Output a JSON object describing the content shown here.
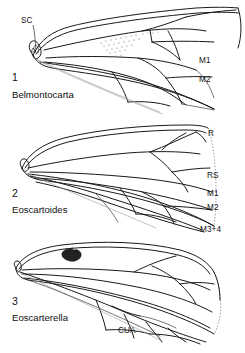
{
  "plate": {
    "title": "Fossil cicadomorph forewing venation plate",
    "background_color": "#ffffff",
    "ink_color": "#1a1a1a",
    "figure_count": 3
  },
  "figures": [
    {
      "number": "1",
      "genus": "Belmontocarta",
      "labels": [
        {
          "name": "SC",
          "text": "SC",
          "x": 22,
          "y": 20,
          "has_leader": true
        },
        {
          "name": "M1",
          "text": "M1",
          "x": 199,
          "y": 61,
          "has_leader": false
        },
        {
          "name": "M2",
          "text": "M2",
          "x": 199,
          "y": 79,
          "has_leader": false
        }
      ],
      "features": [
        "stippled-patch",
        "costal-margin",
        "anal-lobe"
      ]
    },
    {
      "number": "2",
      "genus": "Eoscartoides",
      "labels": [
        {
          "name": "R",
          "text": "R",
          "x": 208,
          "y": 134,
          "has_leader": false
        },
        {
          "name": "RS",
          "text": "RS",
          "x": 208,
          "y": 176,
          "has_leader": false
        },
        {
          "name": "M1",
          "text": "M1",
          "x": 208,
          "y": 194,
          "has_leader": false
        },
        {
          "name": "M2",
          "text": "M2",
          "x": 208,
          "y": 208,
          "has_leader": false
        },
        {
          "name": "M3+4",
          "text": "M3+4",
          "x": 205,
          "y": 228,
          "has_leader": false
        }
      ],
      "features": [
        "dashed-apical-margin",
        "costal-margin",
        "anal-lobe"
      ]
    },
    {
      "number": "3",
      "genus": "Eoscarterella",
      "labels": [
        {
          "name": "CUA",
          "text": "CUA",
          "x": 118,
          "y": 330,
          "has_leader": false
        }
      ],
      "features": [
        "nodal-spot",
        "dashed-apical-margin",
        "costal-margin",
        "anal-lobe"
      ]
    }
  ],
  "vein_legend": {
    "SC": "subcosta",
    "R": "radius",
    "RS": "radial sector",
    "M1": "media branch 1",
    "M2": "media branch 2",
    "M3+4": "media branches 3 plus 4",
    "CUA": "anterior cubitus"
  }
}
